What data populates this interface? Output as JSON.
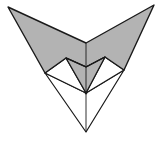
{
  "diagram": {
    "title": "",
    "colors": {
      "fill": "#b3b3b3",
      "stroke": "#1a1a1a",
      "background": "#ffffff",
      "white": "#ffffff"
    },
    "points": {
      "top_left_tip": [
        8,
        7
      ],
      "top_right_tip": [
        154,
        5
      ],
      "center_valley": [
        86,
        43
      ],
      "left_lower_corner": [
        45,
        73
      ],
      "right_lower_corner": [
        124,
        70
      ],
      "left_inner_peak": [
        66,
        58
      ],
      "right_inner_peak": [
        105,
        57
      ],
      "center_mid": [
        86,
        67
      ],
      "center_convergence": [
        86,
        93
      ],
      "bottom_tip": [
        86,
        132
      ]
    }
  }
}
